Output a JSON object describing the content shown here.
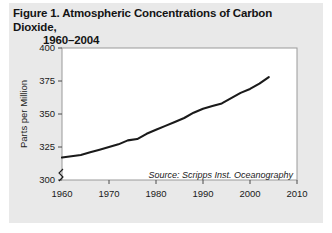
{
  "figure": {
    "title_line1": "Figure 1. Atmospheric Concentrations of Carbon Dioxide,",
    "title_line2": "1960–2004",
    "background_color": "#e9e9e9",
    "plot_background_color": "#ffffff",
    "line_color": "#1a1a1a"
  },
  "chart_data": {
    "type": "line",
    "title": "Figure 1. Atmospheric Concentrations of Carbon Dioxide, 1960–2004",
    "xlabel": "",
    "ylabel": "Parts per Million",
    "xlim": [
      1960,
      2010
    ],
    "ylim": [
      295,
      400
    ],
    "y_axis_break": true,
    "y_axis_break_symbol": "≈",
    "grid": false,
    "legend": "none",
    "xticks": [
      1960,
      1970,
      1980,
      1990,
      2000,
      2010
    ],
    "xtick_labels": [
      "1960",
      "1970",
      "1980",
      "1990",
      "2000",
      "2010"
    ],
    "yticks": [
      300,
      325,
      350,
      375,
      400
    ],
    "ytick_labels": [
      "300",
      "325",
      "350",
      "375",
      "400"
    ],
    "series": [
      {
        "name": "Atmospheric CO2 concentration",
        "x": [
          1960,
          1962,
          1964,
          1966,
          1968,
          1970,
          1972,
          1974,
          1976,
          1978,
          1980,
          1982,
          1984,
          1986,
          1988,
          1990,
          1992,
          1994,
          1996,
          1998,
          2000,
          2002,
          2004
        ],
        "values": [
          317,
          318,
          319,
          321,
          323,
          325,
          327,
          330,
          331,
          335,
          338,
          341,
          344,
          347,
          351,
          354,
          356,
          358,
          362,
          366,
          369,
          373,
          378
        ]
      }
    ],
    "annotations": [
      {
        "text": "Source: Scripps Inst. Oceanography",
        "position": "bottom-right-inside-plot",
        "style": "italic"
      }
    ]
  },
  "axis": {
    "y_title": "Parts per Million",
    "source_note": "Source: Scripps Inst. Oceanography"
  }
}
